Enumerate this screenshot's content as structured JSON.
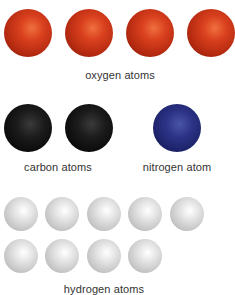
{
  "groups": {
    "oxygen": {
      "label": "oxygen atoms",
      "count": 4,
      "color": "#c8341a"
    },
    "carbon": {
      "label": "carbon atoms",
      "count": 2,
      "color": "#111111"
    },
    "nitrogen": {
      "label": "nitrogen atom",
      "count": 1,
      "color": "#232a78"
    },
    "hydrogen": {
      "label": "hydrogen atoms",
      "count": 9,
      "color": "#d0d0d0"
    }
  }
}
